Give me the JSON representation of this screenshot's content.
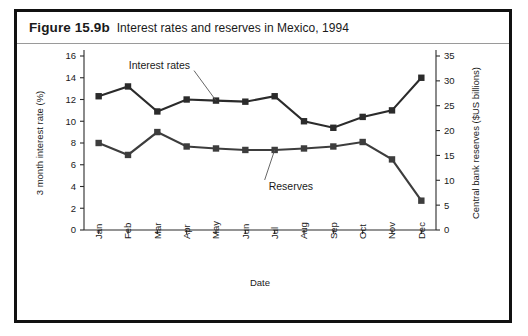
{
  "figure": {
    "number": "Figure 15.9b",
    "caption": "Interest rates and reserves in Mexico, 1994"
  },
  "chart_data": {
    "type": "line",
    "title": "Interest rates and reserves in Mexico, 1994",
    "xlabel": "Date",
    "ylabel": "3 month interest rate (%)",
    "y2label": "Central bank reserves ($US billions)",
    "categories": [
      "Jan",
      "Feb",
      "Mar",
      "Apr",
      "May",
      "Jun",
      "Jul",
      "Aug",
      "Sep",
      "Oct",
      "Nov",
      "Dec"
    ],
    "ylim": [
      0,
      16
    ],
    "yticks": [
      0,
      2,
      4,
      6,
      8,
      10,
      12,
      14,
      16
    ],
    "y2lim": [
      0,
      35
    ],
    "y2ticks": [
      0,
      5,
      10,
      15,
      20,
      25,
      30,
      35
    ],
    "grid": false,
    "legend_position": "inline-annotations",
    "series": [
      {
        "name": "Interest rates",
        "axis": "left",
        "units": "percent",
        "color": "#2b2b2b",
        "marker": "square",
        "values": [
          12.3,
          13.2,
          10.9,
          12.0,
          11.9,
          11.8,
          12.3,
          10.0,
          9.4,
          10.4,
          11.0,
          14.0
        ]
      },
      {
        "name": "Reserves",
        "axis": "right",
        "units": "$US billions",
        "color": "#3d3d3d",
        "marker": "square",
        "values": [
          17.5,
          15.1,
          19.7,
          16.8,
          16.4,
          16.1,
          16.1,
          16.4,
          16.8,
          17.7,
          14.2,
          5.9
        ]
      }
    ],
    "annotations": [
      {
        "text": "Interest rates",
        "target_series": "Interest rates",
        "target_category": "May"
      },
      {
        "text": "Reserves",
        "target_series": "Reserves",
        "target_category": "Jul"
      }
    ]
  }
}
